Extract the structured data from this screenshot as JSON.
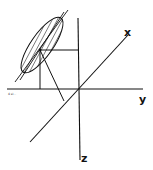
{
  "diagram": {
    "type": "3d-coordinate-sketch",
    "axes": {
      "x": {
        "label": "x"
      },
      "y": {
        "label": "y"
      },
      "z": {
        "label": "z"
      }
    },
    "corner_label": "4 sl...",
    "elements": [
      "shaded tilted ellipse",
      "point with projection lines"
    ],
    "stroke_color": "#111111",
    "background": "#ffffff"
  }
}
